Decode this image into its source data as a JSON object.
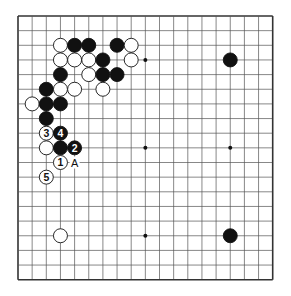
{
  "board": {
    "size": 19,
    "origin_x": 18,
    "origin_y": 16,
    "cell_w": 14.15,
    "cell_h": 14.65,
    "stone_d": 14,
    "line_color": "#555555",
    "edge_color": "#333333",
    "star_points": [
      [
        3,
        9
      ],
      [
        9,
        9
      ],
      [
        15,
        9
      ],
      [
        9,
        15
      ],
      [
        3,
        3
      ],
      [
        3,
        15
      ],
      [
        15,
        3
      ],
      [
        15,
        15
      ],
      [
        9,
        3
      ]
    ],
    "visible_star_points": [
      [
        9,
        3
      ],
      [
        9,
        9
      ],
      [
        15,
        9
      ],
      [
        9,
        15
      ]
    ]
  },
  "stones": [
    {
      "c": 3,
      "r": 2,
      "color": "white"
    },
    {
      "c": 4,
      "r": 2,
      "color": "black"
    },
    {
      "c": 5,
      "r": 2,
      "color": "black"
    },
    {
      "c": 7,
      "r": 2,
      "color": "black"
    },
    {
      "c": 8,
      "r": 2,
      "color": "white"
    },
    {
      "c": 3,
      "r": 3,
      "color": "white"
    },
    {
      "c": 4,
      "r": 3,
      "color": "white"
    },
    {
      "c": 5,
      "r": 3,
      "color": "white"
    },
    {
      "c": 6,
      "r": 3,
      "color": "black"
    },
    {
      "c": 8,
      "r": 3,
      "color": "white"
    },
    {
      "c": 15,
      "r": 3,
      "color": "black"
    },
    {
      "c": 3,
      "r": 4,
      "color": "black"
    },
    {
      "c": 5,
      "r": 4,
      "color": "white"
    },
    {
      "c": 6,
      "r": 4,
      "color": "black"
    },
    {
      "c": 7,
      "r": 4,
      "color": "black"
    },
    {
      "c": 2,
      "r": 5,
      "color": "black"
    },
    {
      "c": 3,
      "r": 5,
      "color": "white"
    },
    {
      "c": 4,
      "r": 5,
      "color": "white"
    },
    {
      "c": 6,
      "r": 5,
      "color": "white"
    },
    {
      "c": 1,
      "r": 6,
      "color": "white"
    },
    {
      "c": 2,
      "r": 6,
      "color": "black"
    },
    {
      "c": 3,
      "r": 6,
      "color": "black"
    },
    {
      "c": 2,
      "r": 7,
      "color": "black"
    },
    {
      "c": 2,
      "r": 8,
      "color": "white",
      "label": "3"
    },
    {
      "c": 3,
      "r": 8,
      "color": "black",
      "label": "4"
    },
    {
      "c": 2,
      "r": 9,
      "color": "white"
    },
    {
      "c": 3,
      "r": 9,
      "color": "black"
    },
    {
      "c": 4,
      "r": 9,
      "color": "black",
      "label": "2"
    },
    {
      "c": 3,
      "r": 10,
      "color": "white",
      "label": "1"
    },
    {
      "c": 2,
      "r": 11,
      "color": "white",
      "label": "5"
    },
    {
      "c": 3,
      "r": 15,
      "color": "white"
    },
    {
      "c": 15,
      "r": 15,
      "color": "black"
    }
  ],
  "markers": [
    {
      "c": 4,
      "r": 10,
      "text": "A"
    }
  ]
}
